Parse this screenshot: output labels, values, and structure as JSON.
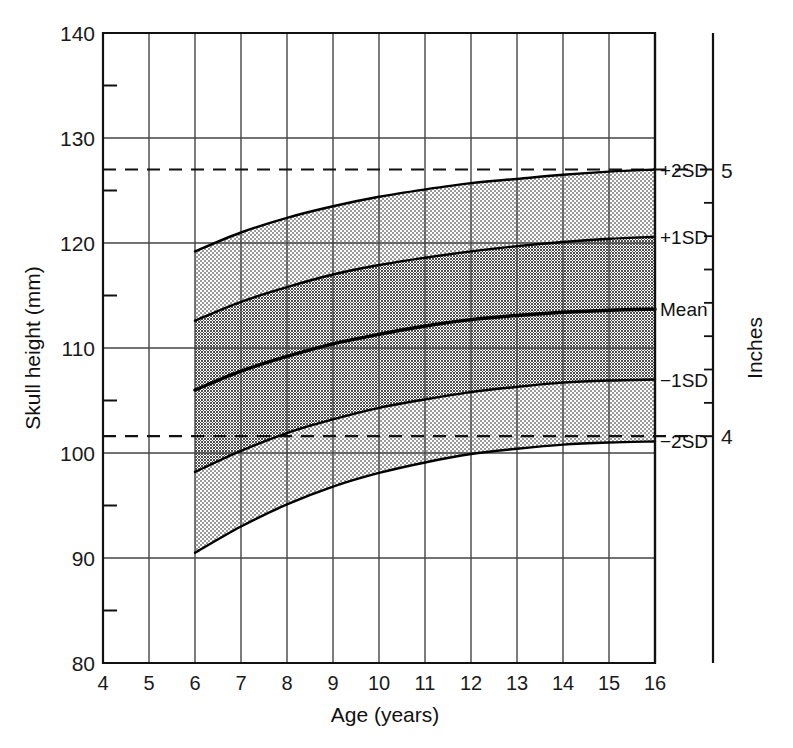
{
  "chart_data": {
    "type": "line",
    "title": "",
    "xlabel": "Age (years)",
    "ylabel": "Skull height (mm)",
    "secondary_ylabel": "Inches",
    "xlim": [
      4,
      16
    ],
    "ylim": [
      80,
      140
    ],
    "secondary_ylim": [
      3.15,
      5.51
    ],
    "grid": true,
    "legend_position": "right-inline",
    "x_ticks": [
      "4",
      "5",
      "6",
      "7",
      "8",
      "9",
      "10",
      "11",
      "12",
      "13",
      "14",
      "15",
      "16"
    ],
    "x_tick_values": [
      4,
      5,
      6,
      7,
      8,
      9,
      10,
      11,
      12,
      13,
      14,
      15,
      16
    ],
    "y_ticks": [
      "80",
      "90",
      "100",
      "110",
      "120",
      "130",
      "140"
    ],
    "y_tick_values": [
      80,
      90,
      100,
      110,
      120,
      130,
      140
    ],
    "y_minor_tick_values": [
      85,
      95,
      105,
      115,
      125,
      135
    ],
    "secondary_y_ticks": [
      "4",
      "5"
    ],
    "secondary_y_tick_values": [
      101.6,
      127.0
    ],
    "secondary_y_minor_tick_values": [
      104.775,
      107.95,
      111.125,
      114.3,
      117.475,
      120.65,
      123.825
    ],
    "x": [
      6,
      7,
      8,
      9,
      10,
      11,
      12,
      13,
      14,
      15,
      16
    ],
    "series": [
      {
        "name": "+2SD",
        "label": "+2SD",
        "values": [
          119.2,
          121.0,
          122.4,
          123.5,
          124.4,
          125.1,
          125.7,
          126.1,
          126.5,
          126.8,
          127.0
        ]
      },
      {
        "name": "+1SD",
        "label": "+1SD",
        "values": [
          112.6,
          114.4,
          115.8,
          117.0,
          117.9,
          118.6,
          119.2,
          119.7,
          120.1,
          120.4,
          120.6
        ]
      },
      {
        "name": "Mean",
        "label": "Mean",
        "values": [
          106.0,
          107.8,
          109.2,
          110.4,
          111.3,
          112.1,
          112.7,
          113.1,
          113.4,
          113.6,
          113.7
        ]
      },
      {
        "name": "-1SD",
        "label": "−1SD",
        "values": [
          98.2,
          100.2,
          101.9,
          103.2,
          104.3,
          105.1,
          105.8,
          106.3,
          106.7,
          106.9,
          107.0
        ]
      },
      {
        "name": "-2SD",
        "label": "−2SD",
        "values": [
          90.5,
          93.0,
          95.1,
          96.8,
          98.1,
          99.1,
          99.9,
          100.4,
          100.8,
          101.0,
          101.1
        ]
      }
    ],
    "bands": [
      {
        "name": "outer-upper-band",
        "from": "+1SD",
        "to": "+2SD",
        "fill": "#cfcfcf"
      },
      {
        "name": "inner-upper-band",
        "from": "Mean",
        "to": "+1SD",
        "fill": "#a6a6a6"
      },
      {
        "name": "inner-lower-band",
        "from": "-1SD",
        "to": "Mean",
        "fill": "#a6a6a6"
      },
      {
        "name": "outer-lower-band",
        "from": "-2SD",
        "to": "-1SD",
        "fill": "#cfcfcf"
      }
    ],
    "reference_lines": [
      {
        "name": "five-inch-line",
        "value": 127.0,
        "style": "dashed",
        "unit": "inches",
        "inches": 5
      },
      {
        "name": "four-inch-line",
        "value": 101.6,
        "style": "dashed",
        "unit": "inches",
        "inches": 4
      }
    ],
    "annotations": [
      {
        "name": "inch-5-label",
        "text": "5",
        "at_value": 127.0
      },
      {
        "name": "inch-4-label",
        "text": "4",
        "at_value": 101.6
      }
    ]
  },
  "colors": {
    "axis": "#111111",
    "grid": "#444444",
    "curve": "#000000",
    "band_light": "#cfcfcf",
    "band_dark": "#a6a6a6",
    "background": "#ffffff"
  }
}
